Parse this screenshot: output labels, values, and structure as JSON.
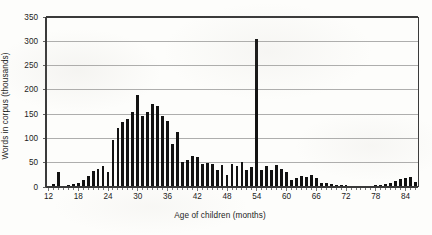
{
  "chart_data": {
    "type": "bar",
    "title": "",
    "subtitle": "",
    "xlabel": "Age of children (months)",
    "ylabel": "Words in corpus (thousands)",
    "xlim": [
      12,
      86
    ],
    "ylim": [
      0,
      350
    ],
    "ytick_values": [
      0,
      50,
      100,
      150,
      200,
      250,
      300,
      350
    ],
    "ytick_labels": [
      "0",
      "50",
      "100",
      "150",
      "200",
      "250",
      "300",
      "350"
    ],
    "xtick_values": [
      12,
      18,
      24,
      30,
      36,
      42,
      48,
      54,
      60,
      66,
      72,
      78,
      84
    ],
    "xtick_labels": [
      "12",
      "18",
      "24",
      "30",
      "36",
      "42",
      "48",
      "54",
      "60",
      "66",
      "72",
      "78",
      "84"
    ],
    "minor_xticks_every": 1,
    "grid": "horizontal",
    "legend": "none",
    "bar_color": "#121212",
    "gridline_color": "#8c8c8c",
    "axis_color": "#3a3a3a",
    "categories": [
      12,
      13,
      14,
      15,
      16,
      17,
      18,
      19,
      20,
      21,
      22,
      23,
      24,
      25,
      26,
      27,
      28,
      29,
      30,
      31,
      32,
      33,
      34,
      35,
      36,
      37,
      38,
      39,
      40,
      41,
      42,
      43,
      44,
      45,
      46,
      47,
      48,
      49,
      50,
      51,
      52,
      53,
      54,
      55,
      56,
      57,
      58,
      59,
      60,
      61,
      62,
      63,
      64,
      65,
      66,
      67,
      68,
      69,
      70,
      71,
      72,
      73,
      74,
      75,
      76,
      77,
      78,
      79,
      80,
      81,
      82,
      83,
      84,
      85,
      86
    ],
    "values": [
      1,
      6,
      30,
      2,
      4,
      6,
      8,
      15,
      22,
      33,
      38,
      44,
      31,
      96,
      122,
      133,
      140,
      155,
      190,
      147,
      155,
      171,
      166,
      146,
      136,
      88,
      114,
      52,
      55,
      64,
      62,
      48,
      50,
      47,
      35,
      46,
      24,
      48,
      43,
      52,
      34,
      41,
      305,
      35,
      44,
      36,
      46,
      38,
      31,
      14,
      18,
      22,
      21,
      25,
      19,
      8,
      9,
      6,
      5,
      4,
      4,
      3,
      3,
      3,
      3,
      3,
      4,
      4,
      6,
      8,
      13,
      17,
      19,
      20,
      10
    ],
    "annotations": [
      {
        "x": 30,
        "y": 190,
        "note": "peak of main distribution"
      },
      {
        "x": 54,
        "y": 305,
        "note": "outlier spike"
      }
    ]
  },
  "axis": {
    "y_title": "Words in corpus (thousands)",
    "x_title": "Age of children (months)"
  }
}
